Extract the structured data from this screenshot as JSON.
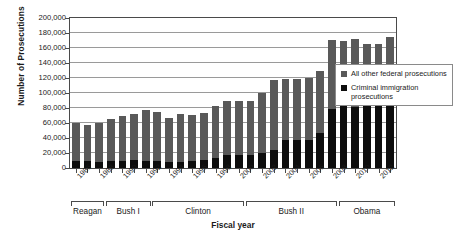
{
  "chart_data": {
    "type": "bar",
    "stacked": true,
    "title": "",
    "xlabel": "Fiscal year",
    "ylabel": "Number of Prosecutions",
    "ylim": [
      0,
      200000
    ],
    "ytick_step": 20000,
    "ytick_labels": [
      "200,000",
      "180,000",
      "160,000",
      "140,000",
      "120,000",
      "100,000",
      "80,000",
      "60,000",
      "40,000",
      "20,000",
      "0"
    ],
    "grid": true,
    "legend_position": "right",
    "categories": [
      "1986",
      "1987",
      "1988",
      "1989",
      "1990",
      "1991",
      "1992",
      "1993",
      "1994",
      "1995",
      "1996",
      "1997",
      "1998",
      "1999",
      "2000",
      "2001",
      "2002",
      "2003",
      "2004",
      "2005",
      "2006",
      "2007",
      "2008",
      "2009",
      "2010",
      "2011",
      "2012",
      "2013"
    ],
    "xtick_labels": [
      "1986",
      "1988",
      "1990",
      "1992",
      "1994",
      "1996",
      "1998",
      "2000",
      "2002",
      "2004",
      "2006",
      "2008",
      "2010",
      "2012"
    ],
    "series": [
      {
        "name": "Criminal immigration prosecutions",
        "color": "#0d0d0d",
        "values": [
          10000,
          9000,
          8500,
          9000,
          10000,
          10500,
          10000,
          9000,
          8500,
          8500,
          9000,
          10500,
          13000,
          17500,
          17500,
          17000,
          20000,
          24000,
          37000,
          37000,
          37000,
          47000,
          79000,
          88000,
          82000,
          86000,
          91000,
          97000
        ]
      },
      {
        "name": "All other federal prosecutions",
        "color": "#595959",
        "values": [
          50000,
          49000,
          51500,
          57000,
          59500,
          62000,
          67000,
          65500,
          58500,
          63000,
          61500,
          62500,
          70000,
          72500,
          71500,
          72000,
          80000,
          94000,
          82000,
          82000,
          83000,
          82000,
          92000,
          82000,
          90000,
          79000,
          75000,
          78000
        ]
      }
    ],
    "totals": [
      60000,
      58000,
      60000,
      66000,
      69500,
      72500,
      77000,
      74500,
      67000,
      71500,
      70500,
      73000,
      83000,
      90000,
      89000,
      89000,
      100000,
      118000,
      119000,
      119000,
      120000,
      129000,
      171000,
      170000,
      172000,
      165000,
      166000,
      175000
    ],
    "presidents": [
      {
        "label": "Reagan",
        "start_year": "1986",
        "end_year": "1988"
      },
      {
        "label": "Bush I",
        "start_year": "1989",
        "end_year": "1992"
      },
      {
        "label": "Clinton",
        "start_year": "1993",
        "end_year": "2000"
      },
      {
        "label": "Bush II",
        "start_year": "2001",
        "end_year": "2008"
      },
      {
        "label": "Obama",
        "start_year": "2009",
        "end_year": "2013"
      }
    ]
  },
  "legend": {
    "items": [
      {
        "label": "All other federal prosecutions",
        "color": "#595959"
      },
      {
        "label": "Criminal immigration prosecutions",
        "color": "#0d0d0d"
      }
    ]
  }
}
